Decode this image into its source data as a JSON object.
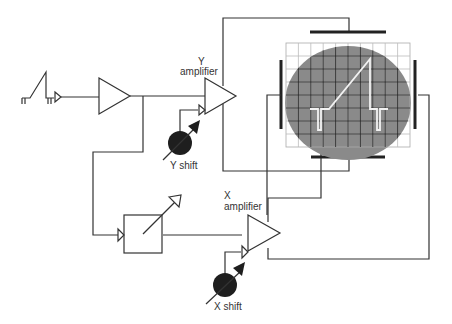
{
  "diagram": {
    "labels": {
      "y_amp_line1": "Y",
      "y_amp_line2": "amplifier",
      "y_shift": "Y shift",
      "x_amp_line1": "X",
      "x_amp_line2": "amplifier",
      "x_shift": "X shift"
    },
    "components": [
      {
        "id": "input-signal",
        "type": "waveform",
        "shape": "sawtooth-pulse"
      },
      {
        "id": "input-amplifier",
        "type": "amplifier"
      },
      {
        "id": "y-amplifier",
        "type": "amplifier"
      },
      {
        "id": "y-shift",
        "type": "variable-control"
      },
      {
        "id": "timebase",
        "type": "variable-box"
      },
      {
        "id": "x-amplifier",
        "type": "amplifier"
      },
      {
        "id": "x-shift",
        "type": "variable-control"
      },
      {
        "id": "crt-screen",
        "type": "display",
        "grid": "10x8"
      },
      {
        "id": "y-deflection-plates",
        "type": "plates",
        "orientation": "horizontal"
      },
      {
        "id": "x-deflection-plates",
        "type": "plates",
        "orientation": "vertical"
      }
    ],
    "colors": {
      "line": "#333333",
      "screen": "#8a8a8a",
      "grid": "#2a2a2a",
      "trace": "#f2f2f2",
      "knob": "#1e1e1e"
    }
  }
}
